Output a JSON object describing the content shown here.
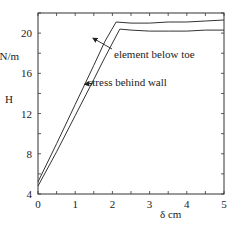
{
  "chart_data": {
    "type": "line",
    "title": "",
    "xlabel": "δ  cm",
    "ylabel": "H",
    "ylabel_unit": "kN/m",
    "ylabel_unit_visible": "kN/m",
    "xlim": [
      0,
      5
    ],
    "ylim": [
      4,
      22
    ],
    "x_ticks": [
      0,
      1,
      2,
      3,
      4,
      5
    ],
    "x_tick_labels": [
      "0",
      "1",
      "2",
      "3",
      "4",
      "5"
    ],
    "y_ticks": [
      4,
      8,
      12,
      16,
      20
    ],
    "y_tick_labels": [
      "4",
      "8",
      "12",
      "16",
      "20"
    ],
    "grid": false,
    "legend": "inline annotations with arrows",
    "series": [
      {
        "name": "element below toe",
        "x": [
          0,
          0.5,
          1.0,
          1.5,
          1.8,
          2.1,
          2.5,
          3.0,
          3.5,
          4.0,
          4.5,
          5.0
        ],
        "y": [
          5.2,
          9.0,
          12.9,
          16.8,
          19.2,
          21.1,
          21.0,
          21.0,
          21.1,
          21.1,
          21.2,
          21.3
        ]
      },
      {
        "name": "stress behind wall",
        "x": [
          0,
          0.5,
          1.0,
          1.5,
          1.8,
          2.2,
          2.5,
          3.0,
          3.5,
          4.0,
          4.5,
          5.0
        ],
        "y": [
          4.8,
          8.2,
          11.8,
          15.4,
          17.6,
          20.4,
          20.3,
          20.2,
          20.2,
          20.2,
          20.3,
          20.3
        ]
      }
    ],
    "annotations": [
      {
        "text": "element below toe",
        "arrow_to": [
          1.45,
          19.6
        ]
      },
      {
        "text": "stress behind wall",
        "arrow_to": [
          1.2,
          15.1
        ]
      }
    ]
  },
  "labels": {
    "y_unit": "kN/m",
    "y_name": "H",
    "x_name": "δ  cm",
    "annot_toe": "element below toe",
    "annot_wall": "stress behind wall"
  }
}
